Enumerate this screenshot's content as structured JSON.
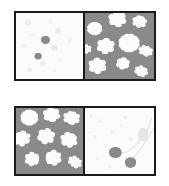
{
  "figure": {
    "title": "",
    "background_color": "#ffffff",
    "frame_border_color": "#1a1a1a",
    "pairs": [
      {
        "id": "top-pair",
        "panels": [
          {
            "id": "top-left",
            "role": "light-sparse-patch",
            "background_color": "#fbfbfb",
            "motif": "scattered-dots",
            "dark_blob_color": "#8a8a8a",
            "faint_blob_color": "#e8e8e8",
            "dark_blobs": [
              {
                "cx": 44,
                "cy": 45,
                "r": 6.5
              },
              {
                "cx": 33,
                "cy": 72,
                "r": 5.2
              }
            ],
            "faint_blobs": [
              {
                "cx": 18,
                "cy": 16,
                "r": 5.0
              },
              {
                "cx": 52,
                "cy": 14,
                "r": 4.0
              },
              {
                "cx": 63,
                "cy": 30,
                "r": 4.6
              },
              {
                "cx": 24,
                "cy": 36,
                "r": 3.2
              },
              {
                "cx": 12,
                "cy": 55,
                "r": 4.2
              },
              {
                "cx": 57,
                "cy": 58,
                "r": 5.0
              },
              {
                "cx": 40,
                "cy": 84,
                "r": 4.5
              },
              {
                "cx": 66,
                "cy": 78,
                "r": 3.6
              },
              {
                "cx": 20,
                "cy": 95,
                "r": 4.0
              },
              {
                "cx": 58,
                "cy": 96,
                "r": 3.0
              }
            ]
          },
          {
            "id": "top-right",
            "role": "gray-dense-flower-patch",
            "background_color": "#8a8a8a",
            "motif": "white-flowers",
            "flower_color": "#fbfbfb",
            "flowers": [
              {
                "cx": 14,
                "cy": 26,
                "r": 10
              },
              {
                "cx": 47,
                "cy": 10,
                "r": 12
              },
              {
                "cx": 78,
                "cy": 14,
                "r": 9
              },
              {
                "cx": 30,
                "cy": 55,
                "r": 12
              },
              {
                "cx": 64,
                "cy": 50,
                "r": 14
              },
              {
                "cx": 86,
                "cy": 62,
                "r": 8
              },
              {
                "cx": 18,
                "cy": 88,
                "r": 12
              },
              {
                "cx": 55,
                "cy": 84,
                "r": 9
              },
              {
                "cx": 80,
                "cy": 96,
                "r": 8
              }
            ]
          }
        ]
      },
      {
        "id": "bottom-pair",
        "panels": [
          {
            "id": "bottom-left",
            "role": "gray-dense-flower-patch",
            "background_color": "#8a8a8a",
            "motif": "white-flowers",
            "flower_color": "#fbfbfb",
            "flowers": [
              {
                "cx": 20,
                "cy": 16,
                "r": 12
              },
              {
                "cx": 52,
                "cy": 11,
                "r": 11
              },
              {
                "cx": 81,
                "cy": 16,
                "r": 10
              },
              {
                "cx": 10,
                "cy": 50,
                "r": 11
              },
              {
                "cx": 45,
                "cy": 47,
                "r": 12
              },
              {
                "cx": 78,
                "cy": 52,
                "r": 11
              },
              {
                "cx": 24,
                "cy": 84,
                "r": 10
              },
              {
                "cx": 56,
                "cy": 82,
                "r": 11
              },
              {
                "cx": 86,
                "cy": 88,
                "r": 8
              }
            ]
          },
          {
            "id": "bottom-right",
            "role": "light-sparse-cherry-patch",
            "background_color": "#fbfbfb",
            "motif": "cherries-with-leaf",
            "dark_blob_color": "#8a8a8a",
            "faint_blob_color": "#ececec",
            "stem_color": "#e4e4e4",
            "leaf_color": "#e6e6e6",
            "dark_blobs": [
              {
                "cx": 44,
                "cy": 74,
                "r": 9
              },
              {
                "cx": 66,
                "cy": 90,
                "r": 8
              }
            ],
            "faint_blobs": [
              {
                "cx": 22,
                "cy": 22,
                "r": 3.2
              },
              {
                "cx": 58,
                "cy": 16,
                "r": 3.0
              },
              {
                "cx": 14,
                "cy": 48,
                "r": 3.4
              },
              {
                "cx": 40,
                "cy": 40,
                "r": 3.0
              },
              {
                "cx": 30,
                "cy": 62,
                "r": 3.0
              },
              {
                "cx": 66,
                "cy": 52,
                "r": 3.2
              },
              {
                "cx": 18,
                "cy": 84,
                "r": 3.0
              },
              {
                "cx": 52,
                "cy": 30,
                "r": 2.6
              }
            ]
          }
        ]
      }
    ]
  }
}
